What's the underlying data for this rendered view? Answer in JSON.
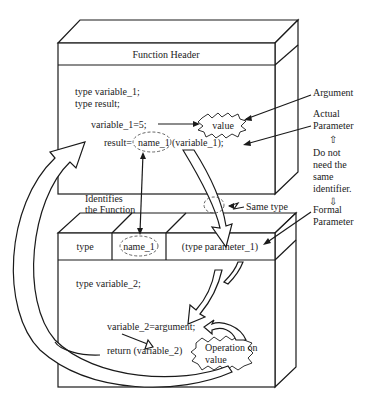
{
  "diagram": {
    "top_box": {
      "header": "Function Header",
      "lines": [
        "type variable_1;",
        "type result;",
        "variable_1=5;",
        "result=",
        "name_1",
        "(variable_1);"
      ],
      "value_burst": "value"
    },
    "bottom_box": {
      "header_cells": [
        "type",
        "name_1",
        "(type parameter_1)"
      ],
      "lines": [
        "type variable_2;",
        "variable_2=argument;",
        "return (variable_2)"
      ],
      "operation_burst_line1": "Operation on",
      "operation_burst_line2": "value"
    },
    "annotations": {
      "argument": "Argument",
      "actual_parameter_1": "Actual",
      "actual_parameter_2": "Parameter",
      "do_not_need": [
        "Do not",
        "need the",
        "same",
        "identifier."
      ],
      "formal_parameter_1": "Formal",
      "formal_parameter_2": "Parameter",
      "identifies_1": "Identifies",
      "identifies_2": "the Function",
      "same_type": "Same type",
      "up_arrow": "⇧",
      "down_arrow": "⇩"
    },
    "colors": {
      "line": "#1a1a1a",
      "text": "#222222",
      "background": "#ffffff"
    }
  }
}
